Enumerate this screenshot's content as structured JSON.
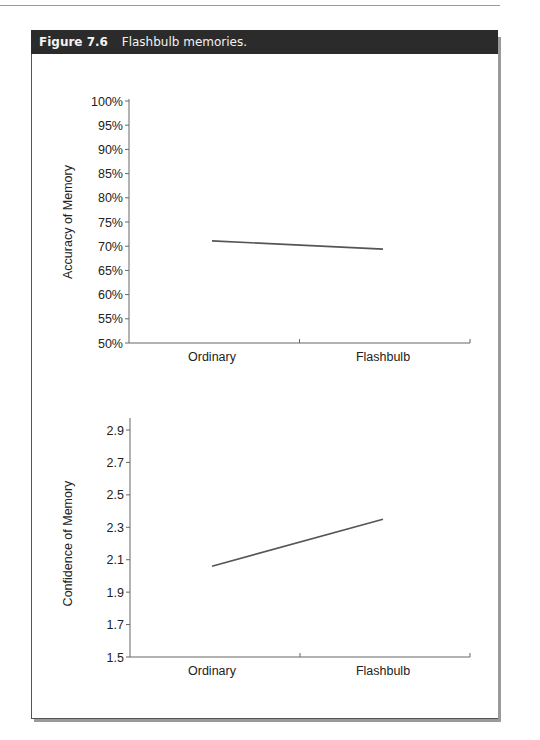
{
  "page": {
    "header_text": "MEMORY, FOUNDATIONS AND APPLICATIONS"
  },
  "figure": {
    "number": "Figure 7.6",
    "caption": "Flashbulb memories.",
    "header_bg": "#2b2b2b",
    "line_color": "#555555"
  },
  "chart_data": [
    {
      "type": "line",
      "title": "",
      "xlabel": "",
      "ylabel": "Accuracy of Memory",
      "categories": [
        "Ordinary",
        "Flashbulb"
      ],
      "series": [
        {
          "name": "Accuracy",
          "values": [
            71.1,
            69.4
          ]
        }
      ],
      "ylim": [
        50,
        100
      ],
      "yticks": [
        "50%",
        "55%",
        "60%",
        "65%",
        "70%",
        "75%",
        "80%",
        "85%",
        "90%",
        "95%",
        "100%"
      ],
      "grid": false,
      "legend": "none"
    },
    {
      "type": "line",
      "title": "",
      "xlabel": "",
      "ylabel": "Confidence of Memory",
      "categories": [
        "Ordinary",
        "Flashbulb"
      ],
      "series": [
        {
          "name": "Confidence",
          "values": [
            2.06,
            2.35
          ]
        }
      ],
      "ylim": [
        1.5,
        3.0
      ],
      "yticks": [
        "1.5",
        "1.7",
        "1.9",
        "2.1",
        "2.3",
        "2.5",
        "2.7",
        "2.9"
      ],
      "grid": false,
      "legend": "none"
    }
  ]
}
